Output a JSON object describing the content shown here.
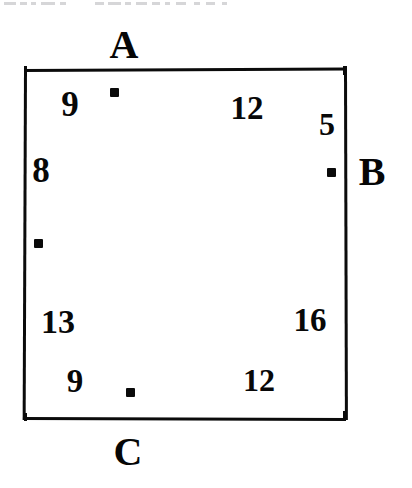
{
  "page": {
    "background_color": "#ffffff",
    "ink_color": "#0a0a0a",
    "width": 412,
    "height": 488
  },
  "scan_artifact": {
    "description": "faint cropped text remnant along the top edge"
  },
  "figure": {
    "shape": "square",
    "frame": {
      "left": 24,
      "top": 69,
      "right": 346,
      "bottom": 420
    },
    "vertex_labels": [
      {
        "label": "A",
        "position": "top-outside",
        "x": 124,
        "y": 45
      },
      {
        "label": "B",
        "position": "right-outside",
        "x": 372,
        "y": 172
      },
      {
        "label": "C",
        "position": "bottom-outside",
        "x": 128,
        "y": 452
      }
    ],
    "markers": [
      {
        "name": "marker-top",
        "x": 114,
        "y": 92
      },
      {
        "name": "marker-right",
        "x": 331,
        "y": 172
      },
      {
        "name": "marker-left",
        "x": 38,
        "y": 243
      },
      {
        "name": "marker-bottom",
        "x": 130,
        "y": 392
      }
    ],
    "numbers": [
      {
        "name": "number-top-left",
        "value": "9",
        "x": 70,
        "y": 104
      },
      {
        "name": "number-top-middle",
        "value": "12",
        "x": 247,
        "y": 108
      },
      {
        "name": "number-top-right",
        "value": "5",
        "x": 327,
        "y": 124
      },
      {
        "name": "number-left-upper",
        "value": "8",
        "x": 41,
        "y": 170
      },
      {
        "name": "number-left-lower",
        "value": "13",
        "x": 58,
        "y": 322
      },
      {
        "name": "number-right-lower",
        "value": "16",
        "x": 310,
        "y": 320
      },
      {
        "name": "number-bottom-left",
        "value": "9",
        "x": 75,
        "y": 381
      },
      {
        "name": "number-bottom-middle",
        "value": "12",
        "x": 259,
        "y": 380
      }
    ]
  }
}
